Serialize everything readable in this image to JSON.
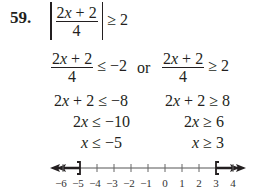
{
  "problem": {
    "number": "59.",
    "statement": {
      "numerator_a": "2",
      "numerator_var": "x",
      "numerator_b": " + 2",
      "denominator": "4",
      "relation": "≥ 2"
    }
  },
  "steps": {
    "left": [
      {
        "numerator_a": "2",
        "numerator_var": "x",
        "numerator_b": " + 2",
        "denominator": "4",
        "relation": "≤ −2"
      },
      {
        "a": "2",
        "var": "x",
        "b": " + 2 ≤ −8"
      },
      {
        "a": "2",
        "var": "x",
        "b": " ≤ −10"
      },
      {
        "a": "",
        "var": "x",
        "b": " ≤ −5"
      }
    ],
    "connector": "or",
    "right": [
      {
        "numerator_a": "2",
        "numerator_var": "x",
        "numerator_b": " + 2",
        "denominator": "4",
        "relation": "≥ 2"
      },
      {
        "a": "2",
        "var": "x",
        "b": " + 2 ≥ 8"
      },
      {
        "a": "2",
        "var": "x",
        "b": " ≥ 6"
      },
      {
        "a": "",
        "var": "x",
        "b": " ≥ 3"
      }
    ]
  },
  "number_line": {
    "ticks": [
      "−6",
      "−5",
      "−4",
      "−3",
      "−2",
      "−1",
      "0",
      "1",
      "2",
      "3",
      "4"
    ],
    "left_endpoint": {
      "value": "−5",
      "bracket": "]"
    },
    "right_endpoint": {
      "value": "3",
      "bracket": "["
    }
  }
}
